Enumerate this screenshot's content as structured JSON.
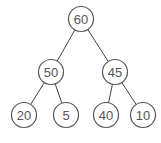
{
  "diagram": {
    "type": "binary-tree",
    "colors": {
      "stroke": "#555555",
      "text": "#555555",
      "background": "#ffffff"
    },
    "nodes": [
      {
        "id": "n0",
        "label": "60",
        "x": 81,
        "y": 19
      },
      {
        "id": "n1",
        "label": "50",
        "x": 51,
        "y": 72
      },
      {
        "id": "n2",
        "label": "45",
        "x": 115,
        "y": 72
      },
      {
        "id": "n3",
        "label": "20",
        "x": 24,
        "y": 115
      },
      {
        "id": "n4",
        "label": "5",
        "x": 66,
        "y": 115
      },
      {
        "id": "n5",
        "label": "40",
        "x": 106,
        "y": 115
      },
      {
        "id": "n6",
        "label": "10",
        "x": 143,
        "y": 115
      }
    ],
    "edges": [
      [
        "n0",
        "n1"
      ],
      [
        "n0",
        "n2"
      ],
      [
        "n1",
        "n3"
      ],
      [
        "n1",
        "n4"
      ],
      [
        "n2",
        "n5"
      ],
      [
        "n2",
        "n6"
      ]
    ]
  }
}
